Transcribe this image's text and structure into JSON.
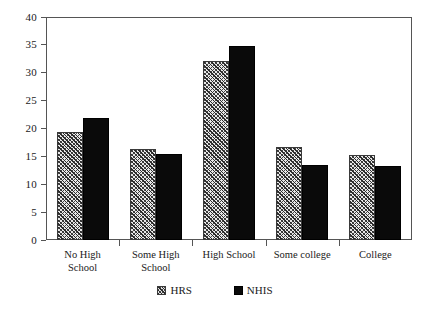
{
  "chart_data": {
    "type": "bar",
    "title": "",
    "subtitle": "",
    "xlabel": "",
    "ylabel": "",
    "ylim": [
      0,
      40
    ],
    "ytick_step": 5,
    "yticks": [
      "0",
      "5",
      "10",
      "15",
      "20",
      "25",
      "30",
      "35",
      "40"
    ],
    "grid": false,
    "legend_position": "bottom-center",
    "categories": [
      "No High\nSchool",
      "Some High\nSchool",
      "High School",
      "Some college",
      "College"
    ],
    "series": [
      {
        "name": "HRS",
        "fill": "diagonal-crosshatch",
        "color": "#e8e8e8",
        "values": [
          19.3,
          16.3,
          32.1,
          16.7,
          15.3
        ]
      },
      {
        "name": "NHIS",
        "fill": "solid",
        "color": "#0a0a0a",
        "values": [
          21.8,
          15.4,
          34.8,
          13.5,
          13.3
        ]
      }
    ]
  },
  "legend": {
    "entries": [
      {
        "label": "HRS"
      },
      {
        "label": "NHIS"
      }
    ]
  },
  "colors": {
    "axis": "#555555",
    "hrs_fill": "#e8e8e8",
    "hrs_hatch": "#2b2b2b",
    "nhis_fill": "#0a0a0a",
    "background": "#ffffff"
  }
}
